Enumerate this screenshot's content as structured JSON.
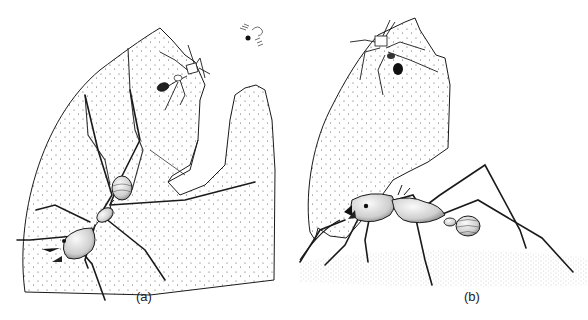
{
  "figure": {
    "panels": [
      {
        "label": "(a)",
        "subject": "leaf-cutter ant cutting a leaf",
        "elements": [
          "large worker ant cutting leaf edge",
          "small minim ant on leaf",
          "phorid fly hovering"
        ]
      },
      {
        "label": "(b)",
        "subject": "leaf-cutter ant carrying leaf fragment",
        "elements": [
          "worker ant carrying leaf fragment",
          "small minim ant riding on leaf fragment",
          "stippled ground"
        ]
      }
    ],
    "colors": {
      "ink": "#1a1a1a",
      "background": "#ffffff",
      "stipple": "#555555"
    }
  }
}
